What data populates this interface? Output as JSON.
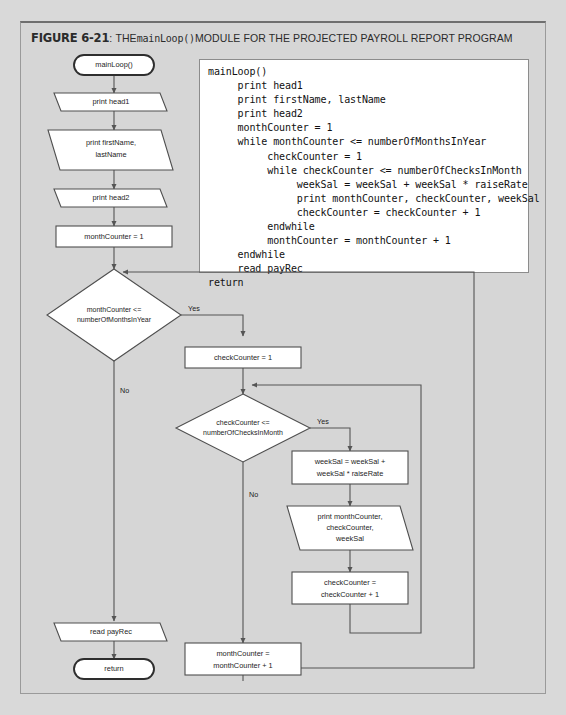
{
  "figure": {
    "label": "FIGURE 6-21",
    "colon": ":",
    "title_before": "THE",
    "title_code": "mainLoop()",
    "title_after": "MODULE FOR THE PROJECTED PAYROLL REPORT PROGRAM"
  },
  "code": {
    "lines": [
      "mainLoop()",
      "     print head1",
      "     print firstName, lastName",
      "     print head2",
      "     monthCounter = 1",
      "     while monthCounter <= numberOfMonthsInYear",
      "          checkCounter = 1",
      "          while checkCounter <= numberOfChecksInMonth",
      "               weekSal = weekSal + weekSal * raiseRate",
      "               print monthCounter, checkCounter, weekSal",
      "               checkCounter = checkCounter + 1",
      "          endwhile",
      "          monthCounter = monthCounter + 1",
      "     endwhile",
      "     read payRec",
      "return"
    ]
  },
  "flowchart": {
    "nodes": {
      "start": {
        "text": "mainLoop()",
        "shape": "terminal"
      },
      "print_head1": {
        "text": "print head1",
        "shape": "io"
      },
      "print_names": {
        "line1": "print firstName,",
        "line2": "lastName",
        "shape": "io"
      },
      "print_head2": {
        "text": "print head2",
        "shape": "io"
      },
      "month_init": {
        "text": "monthCounter = 1",
        "shape": "process"
      },
      "month_decision": {
        "line1": "monthCounter <=",
        "line2": "numberOfMonthsInYear",
        "shape": "decision"
      },
      "check_init": {
        "text": "checkCounter = 1",
        "shape": "process"
      },
      "check_decision": {
        "line1": "checkCounter <=",
        "line2": "numberOfChecksInMonth",
        "shape": "decision"
      },
      "week_sal": {
        "line1": "weekSal = weekSal +",
        "line2": "weekSal * raiseRate",
        "shape": "process"
      },
      "print_detail": {
        "line1": "print monthCounter,",
        "line2": "checkCounter,",
        "line3": "weekSal",
        "shape": "io"
      },
      "check_incr": {
        "line1": "checkCounter =",
        "line2": "checkCounter + 1",
        "shape": "process"
      },
      "month_incr": {
        "line1": "monthCounter =",
        "line2": "monthCounter + 1",
        "shape": "process"
      },
      "read_payrec": {
        "text": "read payRec",
        "shape": "io"
      },
      "end": {
        "text": "return",
        "shape": "terminal"
      }
    },
    "edge_labels": {
      "month_yes": "Yes",
      "month_no": "No",
      "check_yes": "Yes",
      "check_no": "No"
    }
  },
  "colors": {
    "page_background": "#d9d9d9",
    "panel_background": "#d6d6d6",
    "shape_fill": "#ffffff",
    "shape_stroke": "#4f4f4f",
    "code_background": "#ffffff"
  }
}
